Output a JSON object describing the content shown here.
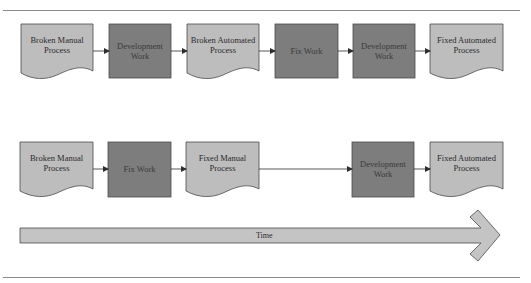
{
  "colors": {
    "document_fill": "#bdbdbd",
    "work_fill": "#7d7d7d",
    "stroke": "#4a4a4a",
    "arrow_fill": "#c4c4c4",
    "rule": "#8a8a8a"
  },
  "rows": [
    {
      "name": "automate-then-fix",
      "steps": [
        {
          "type": "document",
          "label_lines": [
            "Broken Manual",
            "Process"
          ]
        },
        {
          "type": "work",
          "label_lines": [
            "Development",
            "Work"
          ]
        },
        {
          "type": "document",
          "label_lines": [
            "Broken Automated",
            "Process"
          ]
        },
        {
          "type": "work",
          "label_lines": [
            "Fix Work"
          ]
        },
        {
          "type": "work",
          "label_lines": [
            "Development",
            "Work"
          ]
        },
        {
          "type": "document",
          "label_lines": [
            "Fixed Automated",
            "Process"
          ]
        }
      ]
    },
    {
      "name": "fix-then-automate",
      "steps": [
        {
          "type": "document",
          "label_lines": [
            "Broken Manual",
            "Process"
          ]
        },
        {
          "type": "work",
          "label_lines": [
            "Fix Work"
          ]
        },
        {
          "type": "document",
          "label_lines": [
            "Fixed Manual",
            "Process"
          ]
        },
        {
          "type": "work",
          "label_lines": [
            "Development",
            "Work"
          ]
        },
        {
          "type": "document",
          "label_lines": [
            "Fixed Automated",
            "Process"
          ]
        }
      ]
    }
  ],
  "labels": {
    "r1_0": "Broken Manual\nProcess",
    "r1_1": "Development\nWork",
    "r1_2": "Broken Automated\nProcess",
    "r1_3": "Fix Work",
    "r1_4": "Development\nWork",
    "r1_5": "Fixed Automated\nProcess",
    "r2_0": "Broken Manual\nProcess",
    "r2_1": "Fix Work",
    "r2_2": "Fixed Manual\nProcess",
    "r2_3": "Development\nWork",
    "r2_4": "Fixed Automated\nProcess"
  },
  "time_arrow": {
    "label": "Time"
  }
}
